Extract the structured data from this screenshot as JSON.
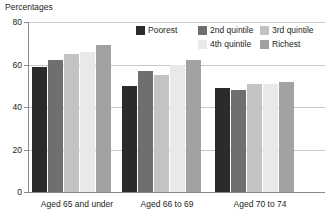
{
  "chart_data": {
    "type": "bar",
    "title": "Percentages",
    "xlabel": "",
    "ylabel": "Percentages",
    "ylim": [
      0,
      80
    ],
    "yticks": [
      0,
      20,
      40,
      60,
      80
    ],
    "ytick_labels": [
      "0",
      "20",
      "40",
      "60",
      "80"
    ],
    "grid": true,
    "legend_position": "top-right",
    "categories": [
      "Aged 65 and under",
      "Aged 66 to 69",
      "Aged 70 to 74"
    ],
    "series": [
      {
        "name": "Poorest",
        "color": "#2b2b2b",
        "values": [
          59,
          50,
          49
        ]
      },
      {
        "name": "2nd quintile",
        "color": "#6f6f6f",
        "values": [
          62,
          57,
          48
        ]
      },
      {
        "name": "3rd quintile",
        "color": "#c3c3c3",
        "values": [
          65,
          55,
          51
        ]
      },
      {
        "name": "4th quintile",
        "color": "#e9e9e9",
        "values": [
          66,
          60,
          51
        ]
      },
      {
        "name": "Richest",
        "color": "#a2a2a2",
        "values": [
          69,
          62,
          52
        ]
      }
    ]
  },
  "legend": {
    "items": [
      {
        "label": "Poorest",
        "color": "#2b2b2b"
      },
      {
        "label": "2nd quintile",
        "color": "#6f6f6f"
      },
      {
        "label": "3rd quintile",
        "color": "#c3c3c3"
      },
      {
        "label": "4th quintile",
        "color": "#e9e9e9"
      },
      {
        "label": "Richest",
        "color": "#a2a2a2"
      }
    ]
  }
}
